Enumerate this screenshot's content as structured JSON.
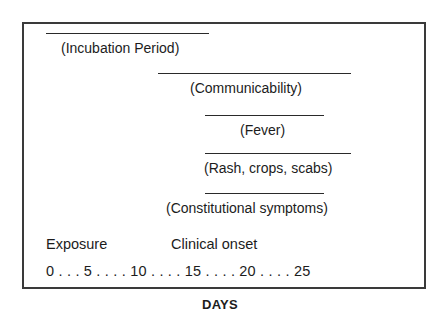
{
  "diagram": {
    "phases": [
      {
        "id": "incubation",
        "label": "(Incubation Period)",
        "start_day": 0,
        "end_day": 9
      },
      {
        "id": "communicability",
        "label": "(Communicability)",
        "start_day": 8,
        "end_day": 19
      },
      {
        "id": "fever",
        "label": "(Fever)",
        "start_day": 10,
        "end_day": 17
      },
      {
        "id": "rash",
        "label": "(Rash, crops, scabs)",
        "start_day": 10,
        "end_day": 19
      },
      {
        "id": "constitutional",
        "label": "(Constitutional symptoms)",
        "start_day": 10,
        "end_day": 17
      }
    ],
    "markers": {
      "exposure": "Exposure",
      "clinical_onset": "Clinical onset"
    },
    "axis": {
      "scale_text": "0 . . . 5 . . . . 10 . . . . 15 . . . . 20 . . . . 25",
      "ticks": [
        0,
        5,
        10,
        15,
        20,
        25
      ],
      "label": "DAYS"
    }
  }
}
